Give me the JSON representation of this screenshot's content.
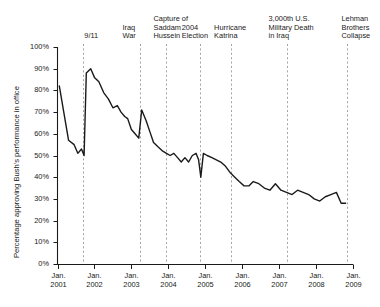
{
  "chart_data": {
    "type": "line",
    "title": "",
    "xlabel": "",
    "ylabel": "Percentage approving Bush's performance in office",
    "ylim": [
      0,
      100
    ],
    "xlim": [
      2001.0,
      2009.0
    ],
    "grid": false,
    "legend": "none",
    "y_ticks": [
      "0%",
      "10%",
      "20%",
      "30%",
      "40%",
      "50%",
      "60%",
      "70%",
      "80%",
      "90%",
      "100%"
    ],
    "y_tick_values": [
      0,
      10,
      20,
      30,
      40,
      50,
      60,
      70,
      80,
      90,
      100
    ],
    "x_ticks": [
      "Jan.\n2001",
      "Jan.\n2002",
      "Jan.\n2003",
      "Jan.\n2004",
      "Jan.\n2005",
      "Jan.\n2006",
      "Jan.\n2007",
      "Jan.\n2008",
      "Jan.\n2009"
    ],
    "x_tick_values": [
      2001,
      2002,
      2003,
      2004,
      2005,
      2006,
      2007,
      2008,
      2009
    ],
    "series": [
      {
        "name": "Bush approval rating",
        "color": "#1a1a1a",
        "x": [
          2001.05,
          2001.15,
          2001.3,
          2001.45,
          2001.55,
          2001.65,
          2001.72,
          2001.78,
          2001.9,
          2002.0,
          2002.12,
          2002.25,
          2002.38,
          2002.5,
          2002.62,
          2002.72,
          2002.82,
          2002.9,
          2003.0,
          2003.1,
          2003.2,
          2003.28,
          2003.4,
          2003.5,
          2003.6,
          2003.72,
          2003.85,
          2003.95,
          2004.05,
          2004.15,
          2004.25,
          2004.35,
          2004.45,
          2004.55,
          2004.65,
          2004.75,
          2004.82,
          2004.88,
          2004.95,
          2005.05,
          2005.18,
          2005.3,
          2005.42,
          2005.55,
          2005.68,
          2005.8,
          2005.92,
          2006.05,
          2006.18,
          2006.3,
          2006.45,
          2006.6,
          2006.75,
          2006.9,
          2007.05,
          2007.2,
          2007.35,
          2007.5,
          2007.65,
          2007.8,
          2007.95,
          2008.1,
          2008.25,
          2008.4,
          2008.55,
          2008.68,
          2008.8
        ],
        "values": [
          82,
          72,
          57,
          55,
          51,
          53,
          50,
          88,
          90,
          86,
          84,
          79,
          76,
          72,
          73,
          70,
          68,
          67,
          62,
          60,
          58,
          71,
          66,
          61,
          56,
          54,
          52,
          51,
          50,
          51,
          49,
          47,
          49,
          47,
          50,
          51,
          48,
          40,
          51,
          50,
          49,
          48,
          47,
          45,
          42,
          40,
          38,
          36,
          36,
          38,
          37,
          35,
          34,
          37,
          34,
          33,
          32,
          34,
          33,
          32,
          30,
          29,
          31,
          32,
          33,
          28,
          28
        ]
      }
    ],
    "annotations": [
      {
        "label": "9/11",
        "x": 2001.7,
        "lines": [
          "9/11"
        ]
      },
      {
        "label": "Iraq War",
        "x": 2003.22,
        "lines": [
          "Iraq",
          "War"
        ]
      },
      {
        "label": "Capture of Saddam Hussein",
        "x": 2003.95,
        "lines": [
          "Capture of",
          "Saddam",
          "Hussein"
        ]
      },
      {
        "label": "2004 Election",
        "x": 2004.85,
        "lines": [
          "2004",
          "Election"
        ]
      },
      {
        "label": "Hurricane Katrina",
        "x": 2005.7,
        "lines": [
          "Hurricane",
          "Katrina"
        ]
      },
      {
        "label": "3,000th U.S. Military Death in Iraq",
        "x": 2007.2,
        "lines": [
          "3,000th U.S.",
          "Military Death",
          "in Iraq"
        ]
      },
      {
        "label": "Lehman Brothers Collapse",
        "x": 2008.85,
        "lines": [
          "Lehman",
          "Brothers",
          "Collapse"
        ]
      }
    ]
  },
  "axis": {
    "y_title": "Percentage approving Bush's performance in office"
  }
}
